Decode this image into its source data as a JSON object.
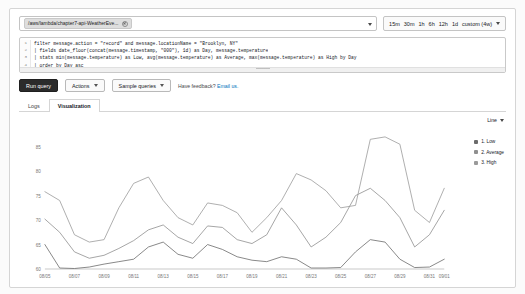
{
  "log_selector": {
    "tag_label": "/aws/lambda/chapter7-api-WeatherEve...",
    "remove_icon": "close-circle-icon",
    "dropdown_icon": "chevron-down-icon"
  },
  "time_range": {
    "options": [
      "15m",
      "30m",
      "1h",
      "6h",
      "12h",
      "1d"
    ],
    "custom_label": "custom (4w)",
    "dropdown_icon": "chevron-down-icon"
  },
  "query_editor": {
    "lines": [
      {
        "num": "1",
        "text": "filter message.action = \"record\" and message.locationName = \"Brooklyn, NY\""
      },
      {
        "num": "2",
        "text": "| fields date_floor(concat(message.timestamp, \"000\"), 1d) as Day, message.temperature"
      },
      {
        "num": "3",
        "text": "| stats min(message.temperature) as Low, avg(message.temperature) as Average, max(message.temperature) as High by Day"
      },
      {
        "num": "4",
        "text": "| order by Day asc"
      }
    ],
    "resize_handle": "resize-grip"
  },
  "toolbar": {
    "run_label": "Run query",
    "actions_label": "Actions",
    "sample_label": "Sample queries",
    "feedback_text": "Have feedback?",
    "feedback_link": "Email us."
  },
  "tabs": [
    {
      "label": "Logs",
      "active": false
    },
    {
      "label": "Visualization",
      "active": true
    }
  ],
  "chart_type": {
    "label": "Line",
    "dropdown_icon": "chevron-down-icon"
  },
  "chart_data": {
    "type": "line",
    "title": "",
    "xlabel": "",
    "ylabel": "",
    "ylim": [
      60,
      88
    ],
    "yticks": [
      85,
      80,
      75,
      70,
      65,
      60
    ],
    "grid": false,
    "legend_position": "right",
    "categories": [
      "08/05",
      "08/06",
      "08/07",
      "08/08",
      "08/09",
      "08/10",
      "08/11",
      "08/12",
      "08/13",
      "08/14",
      "08/15",
      "08/16",
      "08/17",
      "08/18",
      "08/19",
      "08/20",
      "08/21",
      "08/22",
      "08/23",
      "08/24",
      "08/25",
      "08/26",
      "08/27",
      "08/28",
      "08/29",
      "08/30",
      "08/31",
      "09/01"
    ],
    "xticks": [
      "08/05",
      "08/07",
      "08/09",
      "08/11",
      "08/13",
      "08/15",
      "08/17",
      "08/19",
      "08/21",
      "08/23",
      "08/25",
      "08/27",
      "08/29",
      "08/31",
      "09/01"
    ],
    "series": [
      {
        "name": "1. Low",
        "color": "#6b6b6b",
        "values": [
          65.0,
          60.2,
          60.1,
          60.4,
          61.0,
          61.5,
          62.0,
          64.5,
          65.5,
          63.0,
          62.2,
          65.0,
          64.0,
          62.5,
          61.8,
          61.5,
          62.5,
          62.0,
          60.2,
          60.2,
          60.3,
          63.5,
          66.0,
          65.5,
          62.0,
          60.3,
          60.4,
          62.0
        ]
      },
      {
        "name": "2. Average",
        "color": "#8f8f8f",
        "values": [
          70.2,
          67.5,
          63.5,
          62.2,
          62.8,
          64.2,
          65.8,
          68.0,
          69.0,
          66.5,
          65.2,
          68.8,
          68.5,
          66.0,
          65.2,
          67.0,
          72.5,
          69.0,
          64.5,
          66.5,
          69.5,
          75.0,
          76.5,
          74.0,
          70.5,
          64.5,
          67.0,
          72.0
        ]
      },
      {
        "name": "3. High",
        "color": "#9a9a9a",
        "values": [
          75.8,
          74.0,
          67.0,
          65.5,
          66.0,
          72.5,
          77.5,
          78.8,
          74.0,
          70.5,
          69.0,
          73.5,
          73.0,
          71.5,
          67.5,
          70.5,
          74.0,
          79.5,
          78.2,
          76.0,
          72.5,
          73.0,
          86.5,
          87.0,
          85.5,
          72.0,
          69.5,
          76.5
        ]
      }
    ]
  }
}
